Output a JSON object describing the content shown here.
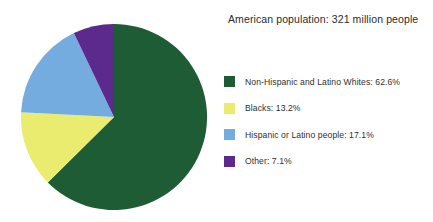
{
  "chart_data": {
    "type": "pie",
    "title": "American population: 321 million people",
    "categories": [
      "Non-Hispanic and Latino Whites",
      "Blacks",
      "Hispanic or Latino people",
      "Other"
    ],
    "values": [
      62.6,
      13.2,
      17.1,
      7.1
    ],
    "value_suffix": "%",
    "colors": [
      "#1d5c34",
      "#e9ec6f",
      "#74ace0",
      "#5b2a8c"
    ],
    "legend_position": "right",
    "start_angle_deg": 0,
    "direction": "clockwise",
    "grid": false,
    "xlabel": "",
    "ylabel": "",
    "labels_formatted": [
      "Non-Hispanic and Latino Whites:  62.6%",
      "Blacks:  13.2%",
      "Hispanic or Latino people:  17.1%",
      "Other:  7.1%"
    ],
    "legend": [
      {
        "name": "Non-Hispanic and Latino Whites",
        "value": "62.6%",
        "color": "#1d5c34"
      },
      {
        "name": "Blacks",
        "value": "13.2%",
        "color": "#e9ec6f"
      },
      {
        "name": "Hispanic or Latino people",
        "value": "17.1%",
        "color": "#74ace0"
      },
      {
        "name": "Other",
        "value": "7.1%",
        "color": "#5b2a8c"
      }
    ]
  }
}
